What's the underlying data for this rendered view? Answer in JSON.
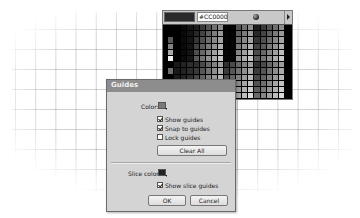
{
  "palette": {
    "preview_color": "#CC0000",
    "hex_value": "#CC0000",
    "wheel_icon": "color-wheel-icon",
    "flyout_icon": "triangle-right-icon"
  },
  "dialog": {
    "title": "Guides",
    "color_label": "Color:",
    "color_value": "#7a7a7a",
    "show_guides": {
      "label": "Show guides",
      "checked": true
    },
    "snap_to_guides": {
      "label": "Snap to guides",
      "checked": true
    },
    "lock_guides": {
      "label": "Lock guides",
      "checked": false
    },
    "clear_all_label": "Clear All",
    "slice_color_label": "Slice color:",
    "slice_color_value": "#222222",
    "show_slice_guides": {
      "label": "Show slice guides",
      "checked": true
    },
    "ok_label": "OK",
    "cancel_label": "Cancel"
  }
}
